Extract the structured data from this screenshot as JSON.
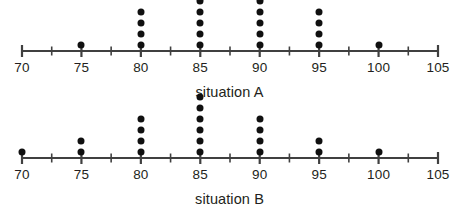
{
  "chart_data": [
    {
      "type": "scatter",
      "subtype": "dotplot",
      "title": "situation A",
      "xlabel": "situation A",
      "ylabel": "",
      "xlim": [
        70,
        105
      ],
      "grid": false,
      "legend": null,
      "axis_color": "#404040",
      "dot_color": "#101010",
      "major_tick_step": 5,
      "minor_tick_step": 2.5,
      "tick_labels": [
        "70",
        "75",
        "80",
        "85",
        "90",
        "95",
        "100",
        "105"
      ],
      "tick_values": [
        70,
        75,
        80,
        85,
        90,
        95,
        100,
        105
      ],
      "categories": [
        70,
        75,
        80,
        85,
        90,
        95,
        100,
        105
      ],
      "values": [
        0,
        1,
        4,
        5,
        5,
        4,
        1,
        0
      ],
      "total_dots": 20
    },
    {
      "type": "scatter",
      "subtype": "dotplot",
      "title": "situation B",
      "xlabel": "situation B",
      "ylabel": "",
      "xlim": [
        70,
        105
      ],
      "grid": false,
      "legend": null,
      "axis_color": "#404040",
      "dot_color": "#101010",
      "major_tick_step": 5,
      "minor_tick_step": 2.5,
      "tick_labels": [
        "70",
        "75",
        "80",
        "85",
        "90",
        "95",
        "100",
        "105"
      ],
      "tick_values": [
        70,
        75,
        80,
        85,
        90,
        95,
        100,
        105
      ],
      "categories": [
        70,
        75,
        80,
        85,
        90,
        95,
        100,
        105
      ],
      "values": [
        1,
        2,
        4,
        6,
        4,
        2,
        1,
        0
      ],
      "total_dots": 20
    }
  ],
  "plots": [
    {
      "id": "a",
      "caption": "situation A",
      "tick_labels": [
        "70",
        "75",
        "80",
        "85",
        "90",
        "95",
        "100",
        "105"
      ]
    },
    {
      "id": "b",
      "caption": "situation B",
      "tick_labels": [
        "70",
        "75",
        "80",
        "85",
        "90",
        "95",
        "100",
        "105"
      ]
    }
  ]
}
